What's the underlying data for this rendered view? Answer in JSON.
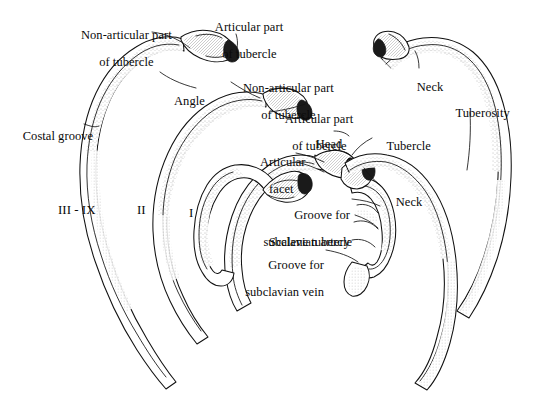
{
  "figure": {
    "background_color": "#ffffff",
    "ink_color": "#111111",
    "width": 534,
    "height": 401
  },
  "labels": [
    {
      "id": "non-articular-part-of-tubercle-upper-left",
      "line1": "Non-articular part",
      "line2": "of tubercle"
    },
    {
      "id": "articular-part-of-tubercle-top",
      "line1": "Articular part",
      "line2": "of tubercle"
    },
    {
      "id": "angle",
      "line1": "Angle",
      "line2": ""
    },
    {
      "id": "costal-groove",
      "line1": "Costal groove",
      "line2": ""
    },
    {
      "id": "non-articular-part-of-tubercle-center",
      "line1": "Non-articular part",
      "line2": "of tubercle"
    },
    {
      "id": "articular-part-of-tubercle-center",
      "line1": "Articular part",
      "line2": "of tubercle"
    },
    {
      "id": "head",
      "line1": "Head",
      "line2": ""
    },
    {
      "id": "articular-facet",
      "line1": "Articular",
      "line2": "facet"
    },
    {
      "id": "tubercle",
      "line1": "Tubercle",
      "line2": ""
    },
    {
      "id": "neck-lower",
      "line1": "Neck",
      "line2": ""
    },
    {
      "id": "neck-upper-right",
      "line1": "Neck",
      "line2": ""
    },
    {
      "id": "tuberosity",
      "line1": "Tuberosity",
      "line2": ""
    },
    {
      "id": "groove-for-subclavian-artery",
      "line1": "Groove for",
      "line2": "subclavian artery"
    },
    {
      "id": "scalene-tubercle",
      "line1": "Scalene tubercle",
      "line2": ""
    },
    {
      "id": "groove-for-subclavian-vein",
      "line1": "Groove for",
      "line2": "subclavian vein"
    }
  ],
  "rib_numbers": [
    {
      "id": "ribs-three-to-nine",
      "text": "III - IX"
    },
    {
      "id": "rib-two",
      "text": "II"
    },
    {
      "id": "rib-one",
      "text": "I"
    }
  ],
  "text": {
    "non_articular_part": "Non-articular part",
    "of_tubercle": "of tubercle",
    "articular_part": "Articular part",
    "angle": "Angle",
    "costal_groove": "Costal groove",
    "head": "Head",
    "articular": "Articular",
    "facet": "facet",
    "tubercle": "Tubercle",
    "neck": "Neck",
    "tuberosity": "Tuberosity",
    "groove_for": "Groove for",
    "subclavian_artery": "subclavian artery",
    "scalene_tubercle": "Scalene tubercle",
    "subclavian_vein": "subclavian vein",
    "roman_three_to_nine": "III - IX",
    "roman_two": "II",
    "roman_one": "I"
  }
}
